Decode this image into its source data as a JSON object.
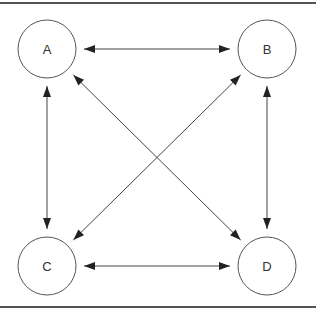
{
  "diagram": {
    "type": "directed-graph",
    "colors": {
      "stroke": "#555555",
      "arrow": "#222222",
      "text": "#333333",
      "background": "#ffffff"
    },
    "nodes": [
      {
        "id": "A",
        "label": "A",
        "position": "top-left"
      },
      {
        "id": "B",
        "label": "B",
        "position": "top-right"
      },
      {
        "id": "C",
        "label": "C",
        "position": "bottom-left"
      },
      {
        "id": "D",
        "label": "D",
        "position": "bottom-right"
      }
    ],
    "edges": [
      {
        "from": "A",
        "to": "B",
        "direction": "bidirectional"
      },
      {
        "from": "A",
        "to": "C",
        "direction": "bidirectional"
      },
      {
        "from": "A",
        "to": "D",
        "direction": "bidirectional"
      },
      {
        "from": "B",
        "to": "C",
        "direction": "bidirectional"
      },
      {
        "from": "B",
        "to": "D",
        "direction": "bidirectional"
      },
      {
        "from": "C",
        "to": "D",
        "direction": "bidirectional"
      }
    ]
  }
}
